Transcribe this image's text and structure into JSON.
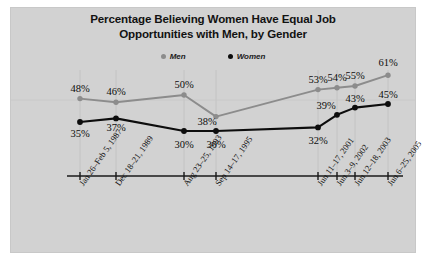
{
  "chart_data": {
    "type": "line",
    "title": "Percentage Believing Women Have Equal Job Opportunities with Men, by Gender",
    "title_lines": [
      "Percentage Believing Women Have Equal Job",
      "Opportunities with Men, by Gender"
    ],
    "xlabel": "",
    "ylabel": "",
    "ylim": [
      25,
      65
    ],
    "grid": "vertical",
    "legend_position": "top-center",
    "categories": [
      "Jan 26–Feb 5, 1987",
      "Dec 18–21, 1989",
      "Aug 23–25, 1993",
      "Sep 14–17, 1995",
      "Jun 11–17, 2001",
      "Jun 3–9, 2002",
      "Jun 12–18, 2003",
      "Jun 6–25, 2005"
    ],
    "series": [
      {
        "name": "Men",
        "color": "#8c8c8c",
        "marker": "circle",
        "values": [
          48,
          46,
          50,
          38,
          53,
          54,
          55,
          61
        ],
        "value_labels": [
          "48%",
          "46%",
          "50%",
          "38%",
          "53%",
          "54%",
          "55%",
          "61%"
        ]
      },
      {
        "name": "Women",
        "color": "#0d0d0d",
        "marker": "circle",
        "values": [
          35,
          37,
          30,
          30,
          32,
          39,
          43,
          45
        ],
        "value_labels": [
          "35%",
          "37%",
          "30%",
          "30%",
          "32%",
          "39%",
          "43%",
          "45%"
        ]
      }
    ]
  },
  "legend": {
    "items": [
      {
        "label": "Men",
        "color": "#8c8c8c"
      },
      {
        "label": "Women",
        "color": "#0d0d0d"
      }
    ]
  },
  "colors": {
    "panel_background": "#d2d2d2",
    "page_background": "#ffffff",
    "men_series": "#8c8c8c",
    "women_series": "#0d0d0d",
    "axis": "#1a1a1a",
    "gridline": "#bdbdbd",
    "text": "#111111"
  }
}
